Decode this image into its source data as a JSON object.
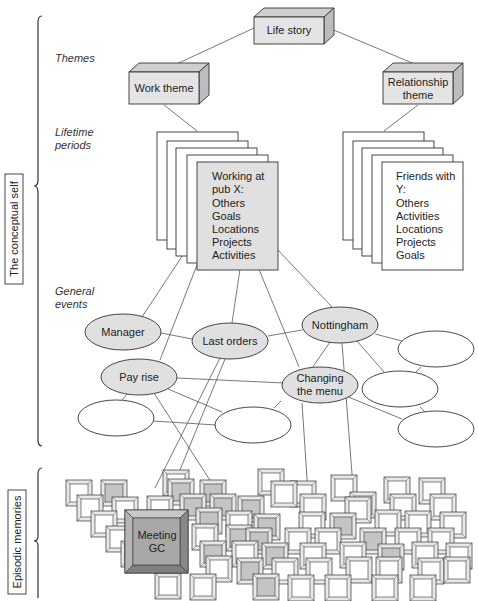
{
  "colors": {
    "gray_fill": "#d8d8d8",
    "light_gray_fill": "#e6e6e6",
    "white_fill": "#ffffff",
    "stroke": "#333333",
    "line": "#555555"
  },
  "side_labels": {
    "conceptual_self": "The conceptual self",
    "episodic_memories": "Episodic memories"
  },
  "level_labels": {
    "themes": "Themes",
    "lifetime_periods_1": "Lifetime",
    "lifetime_periods_2": "periods",
    "general_events_1": "General",
    "general_events_2": "events"
  },
  "top": {
    "life_story": "Life story"
  },
  "themes": {
    "work": "Work theme",
    "relationship_1": "Relationship",
    "relationship_2": "theme"
  },
  "lifetime_periods": {
    "work_period": [
      "Working at",
      "pub X:",
      "Others",
      "Goals",
      "Locations",
      "Projects",
      "Activities"
    ],
    "relationship_period": [
      "Friends with",
      "Y:",
      "Others",
      "Activities",
      "Locations",
      "Projects",
      "Goals"
    ]
  },
  "general_events": {
    "manager": "Manager",
    "last_orders": "Last orders",
    "nottingham": "Nottingham",
    "pay_rise": "Pay rise",
    "changing_menu_1": "Changing",
    "changing_menu_2": "the menu"
  },
  "episodic": {
    "highlight_1": "Meeting",
    "highlight_2": "GC"
  }
}
